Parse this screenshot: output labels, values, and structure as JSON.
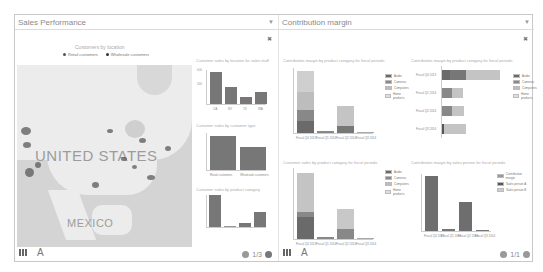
{
  "panels": {
    "left": {
      "title": "Sales Performance",
      "map": {
        "title": "Customers by location",
        "legend": [
          "Retail customers",
          "Wholesale customers"
        ],
        "labels": [
          "UNITED STATES",
          "MEXICO"
        ]
      },
      "charts": [
        {
          "title": "Customer sales by location for sales staff",
          "type": "bar",
          "categories": [
            "CA",
            "NY",
            "TX",
            "WA"
          ],
          "values": [
            520,
            280,
            120,
            220
          ],
          "ylim": [
            0,
            600
          ],
          "yticks": [
            "600",
            "500",
            "400",
            "300",
            "200",
            "100"
          ]
        },
        {
          "title": "Customer sales by customer type",
          "type": "bar",
          "categories": [
            "Retail customers",
            "Wholesale customers"
          ],
          "values": [
            840,
            590
          ],
          "ylim": [
            0,
            1000
          ],
          "yticks": [
            "1000",
            "800",
            "600",
            "400",
            "200"
          ]
        },
        {
          "title": "Customer sales by product category",
          "type": "bar",
          "categories": [
            "Audio products",
            "Cameras",
            "Computer products",
            "Home products"
          ],
          "values": [
            290,
            5,
            40,
            150
          ],
          "ylim": [
            0,
            300
          ],
          "yticks": [
            "300",
            "200",
            "100"
          ]
        }
      ],
      "pager": "1/3",
      "footer": {
        "text_icon": "A"
      }
    },
    "right": {
      "title": "Contribution margin",
      "charts": [
        {
          "title": "Contribution margin by product category for fiscal periods",
          "type": "stacked-bar",
          "categories": [
            "Fiscal Q4 2013",
            "Fiscal Q1 2014",
            "Fiscal Q2 2014",
            "Fiscal Q3 2014"
          ],
          "legend": [
            "Audio",
            "Cameras",
            "Computers",
            "Home products"
          ],
          "series": [
            {
              "name": "Audio",
              "values": [
                30,
                2,
                10,
                1
              ]
            },
            {
              "name": "Cameras",
              "values": [
                40,
                1,
                10,
                0
              ]
            },
            {
              "name": "Computers",
              "values": [
                60,
                1,
                50,
                0
              ]
            },
            {
              "name": "Home products",
              "values": [
                110,
                1,
                0,
                1
              ]
            }
          ],
          "ylim": [
            0,
            250
          ]
        },
        {
          "title": "Contribution margin by product category for fiscal periods",
          "type": "horizontal-stacked-bar",
          "categories": [
            "Fiscal Q4 2013",
            "Fiscal Q1 2014",
            "Fiscal Q2 2014",
            "Fiscal Q3 2014"
          ],
          "legend": [
            "Audio",
            "Cameras",
            "Computers",
            "Home products"
          ],
          "xticks": [
            "0",
            "100",
            "200",
            "300"
          ]
        },
        {
          "title": "Customer sales by product category for fiscal periods",
          "type": "stacked-bar",
          "categories": [
            "Fiscal Q4 2013",
            "Fiscal Q1 2014",
            "Fiscal Q2 2014",
            "Fiscal Q3 2014"
          ],
          "legend": [
            "Audio",
            "Cameras",
            "Computers",
            "Home products"
          ]
        },
        {
          "title": "Contribution margin by sales person for fiscal periods",
          "type": "bar",
          "categories": [
            "Fiscal Q4 2013",
            "Fiscal Q1 2014",
            "Fiscal Q2 2014",
            "Fiscal Q3 2014"
          ],
          "legend": [
            "Contribution margin",
            "Sales person A",
            "Sales person B"
          ],
          "values": [
            210,
            5,
            110,
            3
          ]
        }
      ],
      "pager": "1/1",
      "footer": {
        "text_icon": "A"
      }
    }
  },
  "colors": {
    "bar_dark": "#6a6a6a",
    "bar_mid": "#888888",
    "bar_light": "#bdbdbd",
    "bar_lighter": "#d8d8d8",
    "map_water": "#d4d4d4",
    "map_land": "#ececec"
  }
}
